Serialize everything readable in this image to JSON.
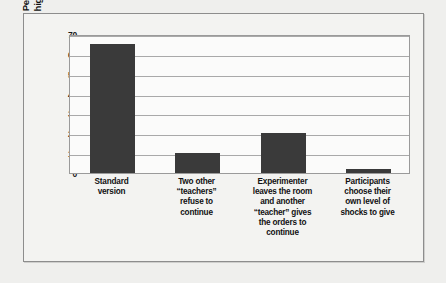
{
  "chart_data": {
    "type": "bar",
    "title": "",
    "xlabel": "",
    "ylabel": "Percentage giving the\nhighest level of shock",
    "ylim": [
      0,
      70
    ],
    "yticks": [
      70,
      60,
      50,
      40,
      30,
      20,
      10,
      0
    ],
    "grid": true,
    "legend": false,
    "bar_color": "#3a3a3a",
    "plot_background": "#fbfbfa",
    "page_background": "#f3f3f1",
    "categories": [
      "Standard\nversion",
      "Two other\n“teachers”\nrefuse to\ncontinue",
      "Experimenter\nleaves the room\nand another\n“teacher” gives\nthe orders to\ncontinue",
      "Participants\nchoose their\nown level of\nshocks to give"
    ],
    "values": [
      65,
      10,
      20,
      2
    ]
  }
}
